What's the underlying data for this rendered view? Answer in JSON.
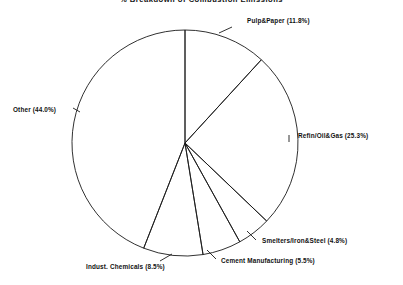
{
  "chart_data": {
    "type": "pie",
    "title": "% Breakdown of Combustion Emissions",
    "title_clipped": true,
    "xlabel": "",
    "ylabel": "",
    "legend": "none",
    "grid": false,
    "start_angle_deg": 90,
    "direction": "clockwise",
    "center": {
      "x": 185,
      "y": 143
    },
    "radius": 113,
    "categories": [
      "Pulp&Paper",
      "Refin/Oil&Gas",
      "Smelters/Iron&Steel",
      "Cement Manufacturing",
      "Indust. Chemicals",
      "Other"
    ],
    "values": [
      11.8,
      25.3,
      4.8,
      5.5,
      8.5,
      44.0
    ],
    "units": "percent",
    "total": 99.9,
    "slices": [
      {
        "label": "Pulp&Paper",
        "value": 11.8,
        "text": "Pulp&Paper (11.8%)",
        "label_x": 247,
        "label_y": 23,
        "anchor": "start",
        "leader": "M 232 27 L 219 33"
      },
      {
        "label": "Refin/Oil&Gas",
        "value": 25.3,
        "text": "Refin/Oil&Gas (25.3%)",
        "label_x": 298,
        "label_y": 138,
        "anchor": "start",
        "leader": "M 289 135 L 289 142"
      },
      {
        "label": "Smelters/Iron&Steel",
        "value": 4.8,
        "text": "Smelters/Iron&Steel (4.8%)",
        "label_x": 262,
        "label_y": 243,
        "anchor": "start",
        "leader": "M 256 240 L 247 231"
      },
      {
        "label": "Cement Manufacturing",
        "value": 5.5,
        "text": "Cement Manufacturing (5.5%)",
        "label_x": 221,
        "label_y": 263,
        "anchor": "start",
        "leader": "M 216 259 L 207 250"
      },
      {
        "label": "Indust. Chemicals",
        "value": 8.5,
        "text": "Indust. Chemicals (8.5%)",
        "label_x": 86,
        "label_y": 269,
        "anchor": "start",
        "leader": "M 160 261 L 172 254"
      },
      {
        "label": "Other",
        "value": 44.0,
        "text": "Other (44.0%)",
        "label_x": 13,
        "label_y": 112,
        "anchor": "start",
        "leader": "M 73 108 L 80 112"
      }
    ],
    "style": {
      "fill": "none",
      "stroke": "#1a1a1a",
      "stroke_width": 0.9,
      "background": "#ffffff"
    }
  }
}
